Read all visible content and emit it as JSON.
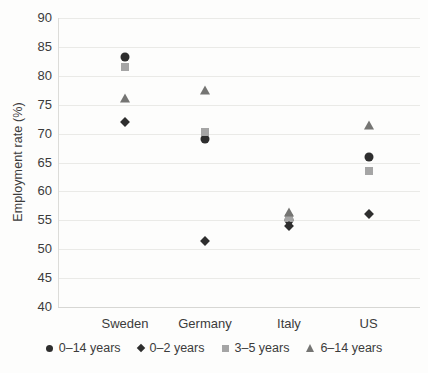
{
  "chart_data": {
    "type": "scatter",
    "title": "",
    "xlabel": "",
    "ylabel": "Employment rate (%)",
    "ylim": [
      40,
      90
    ],
    "yticks": [
      40,
      45,
      50,
      55,
      60,
      65,
      70,
      75,
      80,
      85,
      90
    ],
    "grid": "horizontal",
    "legend_position": "bottom",
    "categories": [
      "Sweden",
      "Germany",
      "Italy",
      "US"
    ],
    "series": [
      {
        "name": "0–14 years",
        "marker": "circle",
        "color": "#2e2e2e",
        "values": [
          83.2,
          69.0,
          55.1,
          66.0
        ]
      },
      {
        "name": "0–2 years",
        "marker": "diamond",
        "color": "#2e2e2e",
        "values": [
          72.0,
          51.5,
          54.0,
          56.1
        ]
      },
      {
        "name": "3–5 years",
        "marker": "square",
        "color": "#a5a5a5",
        "values": [
          81.5,
          70.3,
          55.4,
          63.6
        ]
      },
      {
        "name": "6–14 years",
        "marker": "triangle",
        "color": "#757573",
        "values": [
          76.1,
          77.6,
          56.5,
          71.5
        ]
      }
    ],
    "category_x_fractions": [
      0.185,
      0.406,
      0.638,
      0.858
    ]
  },
  "layout_hints": {
    "plot": {
      "left": 58,
      "top": 18,
      "width": 362,
      "height": 289
    },
    "colors": {
      "background": "#fdfdfc",
      "gridline": "#eaeae7",
      "axis_line": "#d7d7d4",
      "text": "#3b3b3b"
    }
  }
}
